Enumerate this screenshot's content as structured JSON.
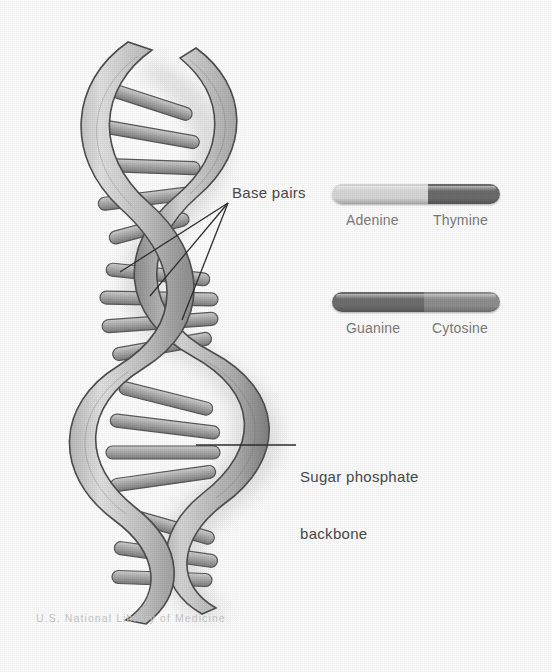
{
  "figure": {
    "credit": "U.S. National Library of Medicine"
  },
  "annotations": {
    "base_pairs": "Base pairs",
    "backbone_line1": "Sugar phosphate",
    "backbone_line2": "backbone"
  },
  "legend": {
    "pairs": [
      {
        "id": "adenine-thymine",
        "left_label": "Adenine",
        "right_label": "Thymine",
        "left_color": "#d9d9d9",
        "right_color": "#6d6d6d",
        "split_percent": 57
      },
      {
        "id": "guanine-cytosine",
        "left_label": "Guanine",
        "right_label": "Cytosine",
        "left_color": "#6f6f6f",
        "right_color": "#8f8f8f",
        "split_percent": 55
      }
    ]
  },
  "colors": {
    "background": "#ffffff",
    "ribbon_light": "#cfcfcf",
    "ribbon_mid": "#a8a8a8",
    "ribbon_dark": "#6e6e6e",
    "outline": "#4f4f4f",
    "rung": "#b2b2b2",
    "shadow": "#cccccc",
    "text": "#4a4a4a",
    "label_text": "#7c7c7c",
    "credit_text": "#c9c9c9"
  }
}
